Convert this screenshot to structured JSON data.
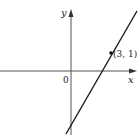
{
  "diagram": {
    "type": "coordinate-graph",
    "axes": {
      "x_label": "x",
      "y_label": "y",
      "origin_label": "0"
    },
    "line": {
      "description": "straight line with positive slope through labeled point",
      "color": "#1a1a1a"
    },
    "point": {
      "label": "(3, 1)",
      "x": 3,
      "y": 1
    },
    "colors": {
      "axis": "#555555",
      "line": "#1a1a1a",
      "text": "#222222",
      "background": "#ffffff"
    }
  }
}
